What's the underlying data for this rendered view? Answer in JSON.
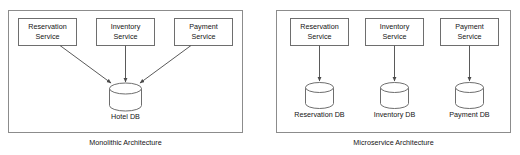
{
  "diagram": {
    "background_color": "#ffffff",
    "line_color": "#6e6e6e",
    "panel_border_color": "#8c8c8c",
    "text_color": "#141414",
    "panels": [
      {
        "id": "monolithic",
        "caption": "Monolithic Architecture",
        "services": [
          {
            "id": "reservation",
            "line1": "Reservation",
            "line2": "Service"
          },
          {
            "id": "inventory",
            "line1": "Inventory",
            "line2": "Service"
          },
          {
            "id": "payment",
            "line1": "Payment",
            "line2": "Service"
          }
        ],
        "databases": [
          {
            "id": "hotel-db",
            "label": "Hotel DB"
          }
        ],
        "connections": [
          {
            "from": "reservation",
            "to": "hotel-db",
            "style": "diagonal-arrow"
          },
          {
            "from": "inventory",
            "to": "hotel-db",
            "style": "vertical-arrow"
          },
          {
            "from": "payment",
            "to": "hotel-db",
            "style": "diagonal-arrow"
          }
        ]
      },
      {
        "id": "microservice",
        "caption": "Microservice Architecture",
        "services": [
          {
            "id": "reservation",
            "line1": "Reservation",
            "line2": "Service"
          },
          {
            "id": "inventory",
            "line1": "Inventory",
            "line2": "Service"
          },
          {
            "id": "payment",
            "line1": "Payment",
            "line2": "Service"
          }
        ],
        "databases": [
          {
            "id": "reservation-db",
            "label": "Reservation DB"
          },
          {
            "id": "inventory-db",
            "label": "Inventory DB"
          },
          {
            "id": "payment-db",
            "label": "Payment DB"
          }
        ],
        "connections": [
          {
            "from": "reservation",
            "to": "reservation-db",
            "style": "vertical-arrow"
          },
          {
            "from": "inventory",
            "to": "inventory-db",
            "style": "vertical-arrow"
          },
          {
            "from": "payment",
            "to": "payment-db",
            "style": "vertical-arrow"
          }
        ]
      }
    ]
  }
}
